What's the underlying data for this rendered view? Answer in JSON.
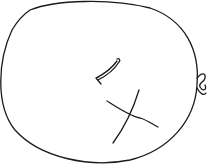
{
  "sketch": {
    "subject": "balloon",
    "stroke_color": "#1a1a1a",
    "background": "#ffffff",
    "parts": [
      "outline",
      "knot",
      "highlight-arrow",
      "cross-mark"
    ]
  }
}
